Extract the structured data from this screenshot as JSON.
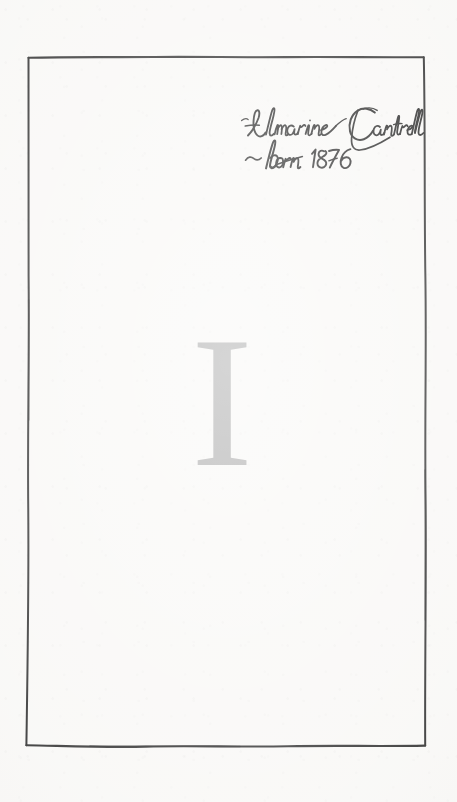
{
  "page": {
    "kind": "book-chapter-opening-page",
    "paper_color": "#f8f7f5",
    "ink_color": "#1a1a1a"
  },
  "frame": {
    "name": "hand-drawn-ink-border",
    "color": "#1d1d1d",
    "style": "irregular hand-ruled rectangle",
    "corners": {
      "top_left": [
        28,
        57
      ],
      "top_right": [
        424,
        57
      ],
      "bottom_right": [
        425,
        746
      ],
      "bottom_left": [
        26,
        745
      ]
    }
  },
  "inscription": {
    "name": "handwritten-ownership-inscription",
    "script": "cursive",
    "ink_color": "#141414",
    "line1": "Almarine Cantrell",
    "line2": "~ born 1876",
    "name_text": "Almarine Cantrell",
    "birth_text": "born 1876",
    "birth_year": "1876",
    "dash_mark": "~"
  },
  "chapter": {
    "name": "chapter-numeral",
    "numeral": "I",
    "numeral_arabic": "1",
    "color": "#a3a3a3"
  }
}
